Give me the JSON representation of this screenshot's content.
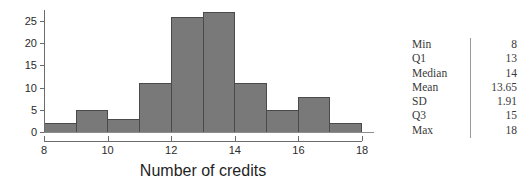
{
  "chart_data": {
    "type": "bar",
    "title": "",
    "xlabel": "Number of credits",
    "ylabel": "",
    "categories": [
      "8-9",
      "9-10",
      "10-11",
      "11-12",
      "12-13",
      "13-14",
      "14-15",
      "15-16",
      "16-17",
      "17-18"
    ],
    "bin_edges": [
      8,
      9,
      10,
      11,
      12,
      13,
      14,
      15,
      16,
      17,
      18
    ],
    "values": [
      2,
      5,
      3,
      11,
      26,
      27,
      11,
      5,
      8,
      2
    ],
    "xlim": [
      8,
      18
    ],
    "ylim": [
      0,
      27.5
    ],
    "x_ticks": [
      8,
      10,
      12,
      14,
      16,
      18
    ],
    "x_tick_labels": [
      "8",
      "10",
      "12",
      "14",
      "16",
      "18"
    ],
    "y_ticks": [
      0,
      5,
      10,
      15,
      20,
      25
    ],
    "y_tick_labels": [
      "0",
      "5",
      "10",
      "15",
      "20",
      "25"
    ],
    "grid": false,
    "legend": false,
    "bar_fill_color": "#797979",
    "bar_border_color": "#4a4a4a",
    "axis_color": "#6b6b6b"
  },
  "stats": {
    "rows": [
      {
        "label": "Min",
        "value": "8"
      },
      {
        "label": "Q1",
        "value": "13"
      },
      {
        "label": "Median",
        "value": "14"
      },
      {
        "label": "Mean",
        "value": "13.65"
      },
      {
        "label": "SD",
        "value": "1.91"
      },
      {
        "label": "Q3",
        "value": "15"
      },
      {
        "label": "Max",
        "value": "18"
      }
    ]
  }
}
